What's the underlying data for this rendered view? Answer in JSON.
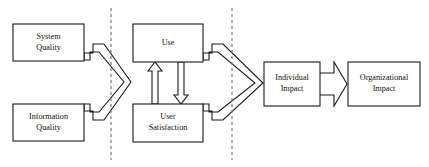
{
  "diagram": {
    "type": "flow-model",
    "background_color": "#ffffff",
    "line_color": "#1a1a1a",
    "divider_color": "#6e6e6e",
    "nodes": [
      {
        "id": "system-quality",
        "label_line1": "System",
        "label_line2": "Quality"
      },
      {
        "id": "information-quality",
        "label_line1": "Information",
        "label_line2": "Quality"
      },
      {
        "id": "use",
        "label_line1": "Use",
        "label_line2": ""
      },
      {
        "id": "user-satisfaction",
        "label_line1": "User",
        "label_line2": "Satisfaction"
      },
      {
        "id": "individual-impact",
        "label_line1": "Individual",
        "label_line2": "Impact"
      },
      {
        "id": "organizational-impact",
        "label_line1": "Organizational",
        "label_line2": "Impact"
      }
    ],
    "connectors": [
      {
        "id": "quality-to-use-merge",
        "from": "system-quality,information-quality",
        "to": "use,user-satisfaction",
        "style": "merge-chevron"
      },
      {
        "id": "use-to-satisfaction",
        "from": "user-satisfaction",
        "to": "use",
        "style": "block-arrow-up"
      },
      {
        "id": "satisfaction-to-use",
        "from": "use",
        "to": "user-satisfaction",
        "style": "block-arrow-down"
      },
      {
        "id": "usage-to-individual-merge",
        "from": "use,user-satisfaction",
        "to": "individual-impact",
        "style": "merge-chevron"
      },
      {
        "id": "individual-to-organizational",
        "from": "individual-impact",
        "to": "organizational-impact",
        "style": "open-block-arrow"
      }
    ],
    "dividers": [
      {
        "id": "divider-left",
        "x": 111
      },
      {
        "id": "divider-right",
        "x": 232
      }
    ]
  }
}
